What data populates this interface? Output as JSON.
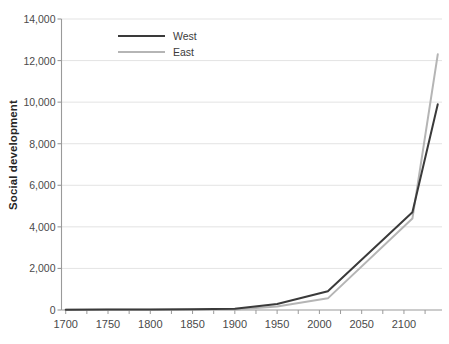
{
  "chart_data": {
    "type": "line",
    "title": "",
    "xlabel": "",
    "ylabel": "Social development",
    "xlim": [
      1695,
      2145
    ],
    "ylim": [
      0,
      14000
    ],
    "grid": true,
    "legend_position": "top-left-inside",
    "x_ticks": [
      1700,
      1750,
      1800,
      1850,
      1900,
      1950,
      2000,
      2050,
      2100
    ],
    "x_tick_labels": [
      "1700",
      "1750",
      "1800",
      "1850",
      "1900",
      "1950",
      "2000",
      "2050",
      "2100"
    ],
    "x_minor_tick_step": 25,
    "y_ticks": [
      0,
      2000,
      4000,
      6000,
      8000,
      10000,
      12000,
      14000
    ],
    "y_tick_labels": [
      "0",
      "2,000",
      "4,000",
      "6,000",
      "8,000",
      "10,000",
      "12,000",
      "14,000"
    ],
    "series": [
      {
        "name": "West",
        "color": "#3a3a3a",
        "line_width": 2.0,
        "x": [
          1700,
          1750,
          1800,
          1850,
          1900,
          1950,
          2010,
          2110,
          2140
        ],
        "values": [
          16,
          19,
          23,
          32,
          60,
          290,
          900,
          4700,
          9900
        ]
      },
      {
        "name": "East",
        "color": "#b5b5b5",
        "line_width": 2.0,
        "x": [
          1700,
          1750,
          1800,
          1850,
          1900,
          1950,
          2010,
          2110,
          2140
        ],
        "values": [
          15,
          16,
          18,
          22,
          30,
          170,
          560,
          4400,
          12300
        ]
      }
    ]
  },
  "legend": {
    "entries": [
      {
        "label": "West",
        "color": "#3a3a3a"
      },
      {
        "label": "East",
        "color": "#b5b5b5"
      }
    ]
  },
  "axes": {
    "y_title": "Social development"
  },
  "caption": {
    "text": " "
  }
}
